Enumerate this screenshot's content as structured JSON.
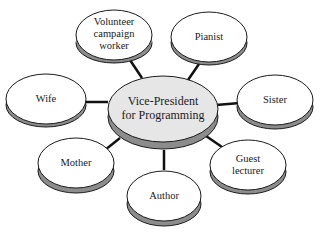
{
  "diagram": {
    "type": "hub-and-spoke role diagram",
    "center": {
      "label_lines": [
        "Vice-President",
        "for Programming"
      ],
      "fill": "#e6e6e6",
      "side": "#8c8c8c"
    },
    "nodes": [
      {
        "id": "volunteer",
        "label_lines": [
          "Volunteer",
          "campaign",
          "worker"
        ]
      },
      {
        "id": "pianist",
        "label_lines": [
          "Pianist"
        ]
      },
      {
        "id": "wife",
        "label_lines": [
          "Wife"
        ]
      },
      {
        "id": "sister",
        "label_lines": [
          "Sister"
        ]
      },
      {
        "id": "mother",
        "label_lines": [
          "Mother"
        ]
      },
      {
        "id": "guest-lecturer",
        "label_lines": [
          "Guest",
          "lecturer"
        ]
      },
      {
        "id": "author",
        "label_lines": [
          "Author"
        ]
      }
    ],
    "colors": {
      "node_fill": "#ffffff",
      "node_side": "#8c8c8c",
      "outline": "#1a1a1a",
      "connector": "#111111"
    }
  }
}
